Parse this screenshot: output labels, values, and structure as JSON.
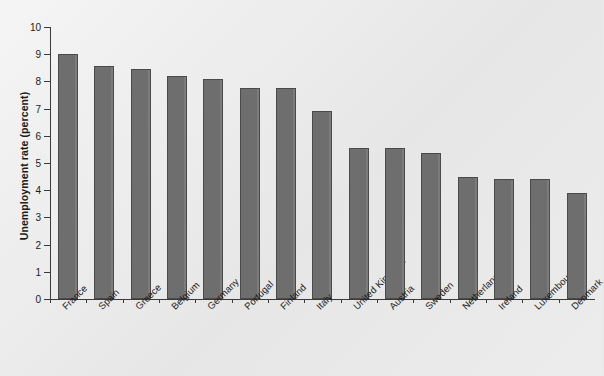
{
  "chart_data": {
    "type": "bar",
    "title": "",
    "xlabel": "",
    "ylabel": "Unemployment rate (percent)",
    "ylim": [
      0,
      10
    ],
    "ytick_labels": [
      "10",
      "9",
      "8",
      "7",
      "6",
      "5",
      "4",
      "3",
      "2",
      "1",
      "0"
    ],
    "yticks": [
      10,
      9,
      8,
      7,
      6,
      5,
      4,
      3,
      2,
      1,
      0
    ],
    "grid": false,
    "legend": null,
    "bar_color": "#6e6e6e",
    "bar_edge_color": "#4a4a4a",
    "categories": [
      "France",
      "Spain",
      "Greece",
      "Belgium",
      "Germany",
      "Portugal",
      "Finland",
      "Italy",
      "United Kingdom",
      "Austria",
      "Sweden",
      "Netherlands",
      "Ireland",
      "Luxembourg",
      "Denmark"
    ],
    "values": [
      9.0,
      8.55,
      8.45,
      8.2,
      8.1,
      7.75,
      7.75,
      6.9,
      5.55,
      5.55,
      5.35,
      4.5,
      4.4,
      4.4,
      3.9
    ]
  }
}
